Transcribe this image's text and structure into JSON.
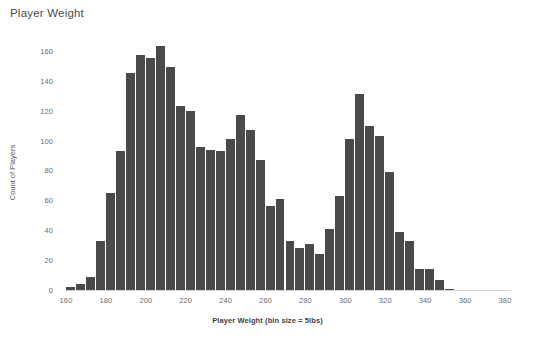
{
  "header": {
    "title": "Player Weight"
  },
  "chart_data": {
    "type": "bar",
    "title": "Player Weight",
    "xlabel": "Player Weight (bin size = 5lbs)",
    "ylabel": "Count of Players",
    "bin_size": 5,
    "grid": false,
    "legend": "none",
    "xlim": [
      160,
      380
    ],
    "ylim": [
      0,
      170
    ],
    "xticks": [
      160,
      180,
      200,
      220,
      240,
      260,
      280,
      300,
      320,
      340,
      360,
      380
    ],
    "yticks": [
      0,
      20,
      40,
      60,
      80,
      100,
      120,
      140,
      160
    ],
    "bar_color": "#4a4a4a",
    "axis_text_color": "#6e6e6e",
    "categories": [
      160,
      165,
      170,
      175,
      180,
      185,
      190,
      195,
      200,
      205,
      210,
      215,
      220,
      225,
      230,
      235,
      240,
      245,
      250,
      255,
      260,
      265,
      270,
      275,
      280,
      285,
      290,
      295,
      300,
      305,
      310,
      315,
      320,
      325,
      330,
      335,
      340,
      345,
      350,
      355,
      360,
      375
    ],
    "values": [
      2,
      4,
      9,
      33,
      65,
      93,
      145,
      157,
      155,
      163,
      149,
      123,
      120,
      96,
      94,
      93,
      101,
      117,
      107,
      87,
      56,
      61,
      33,
      28,
      31,
      24,
      41,
      63,
      101,
      131,
      110,
      103,
      79,
      39,
      33,
      14,
      14,
      7,
      1,
      0,
      0,
      0
    ]
  }
}
